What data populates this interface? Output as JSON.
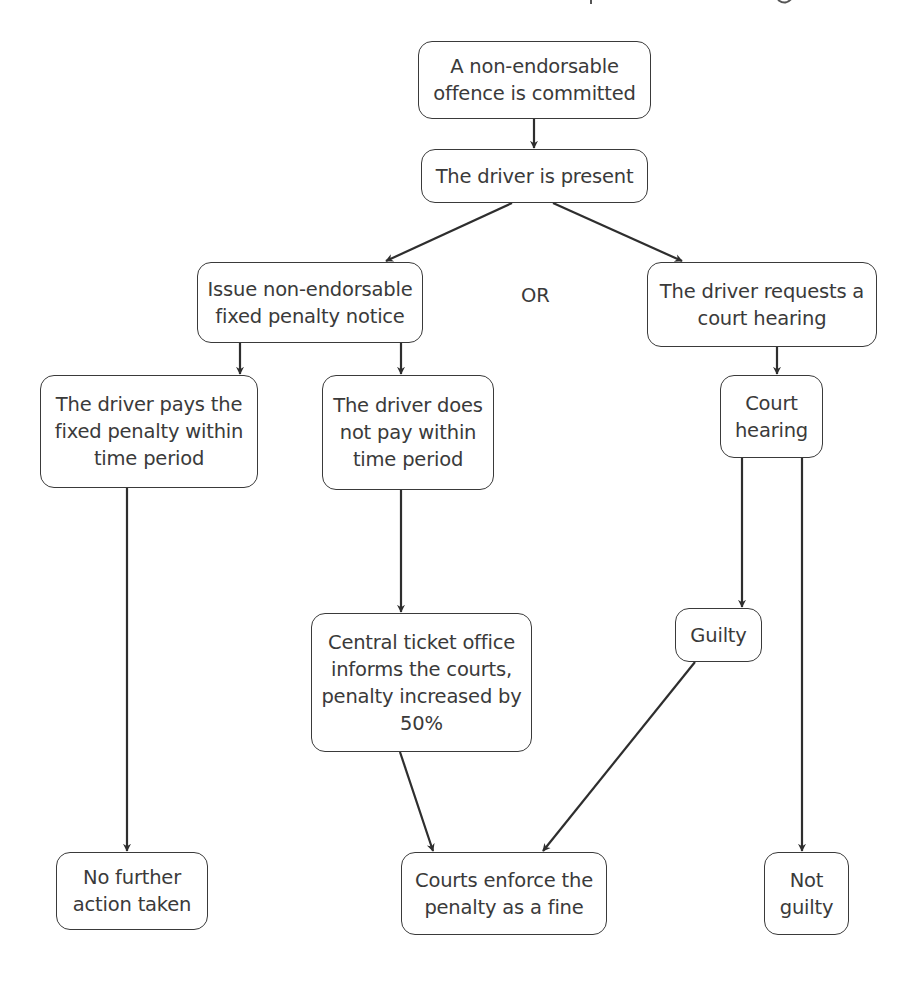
{
  "diagram": {
    "type": "flowchart",
    "colors": {
      "stroke": "#3a3a3a",
      "text": "#3a3a3a",
      "background": "#ffffff"
    },
    "nodes": {
      "offence": {
        "label": "A non-endorsable\noffence is committed"
      },
      "driver_present": {
        "label": "The driver is present"
      },
      "issue_notice": {
        "label": "Issue non-endorsable\nfixed penalty notice"
      },
      "request_hearing": {
        "label": "The driver requests a\ncourt hearing"
      },
      "driver_pays": {
        "label": "The driver pays the\nfixed penalty within\ntime period"
      },
      "driver_not_pay": {
        "label": "The driver does\nnot pay within\ntime period"
      },
      "court_hearing": {
        "label": "Court\nhearing"
      },
      "central_ticket": {
        "label": "Central ticket office\ninforms the courts,\npenalty increased by\n50%"
      },
      "guilty": {
        "label": "Guilty"
      },
      "no_further_action": {
        "label": "No further\naction taken"
      },
      "courts_enforce": {
        "label": "Courts enforce the\npenalty as a fine"
      },
      "not_guilty": {
        "label": "Not\nguilty"
      }
    },
    "separator_label": "OR",
    "edges": [
      {
        "from": "offence",
        "to": "driver_present"
      },
      {
        "from": "driver_present",
        "to": "issue_notice"
      },
      {
        "from": "driver_present",
        "to": "request_hearing"
      },
      {
        "from": "issue_notice",
        "to": "driver_pays"
      },
      {
        "from": "issue_notice",
        "to": "driver_not_pay"
      },
      {
        "from": "request_hearing",
        "to": "court_hearing"
      },
      {
        "from": "driver_pays",
        "to": "no_further_action"
      },
      {
        "from": "driver_not_pay",
        "to": "central_ticket"
      },
      {
        "from": "central_ticket",
        "to": "courts_enforce"
      },
      {
        "from": "court_hearing",
        "to": "guilty"
      },
      {
        "from": "court_hearing",
        "to": "not_guilty"
      },
      {
        "from": "guilty",
        "to": "courts_enforce"
      }
    ]
  }
}
